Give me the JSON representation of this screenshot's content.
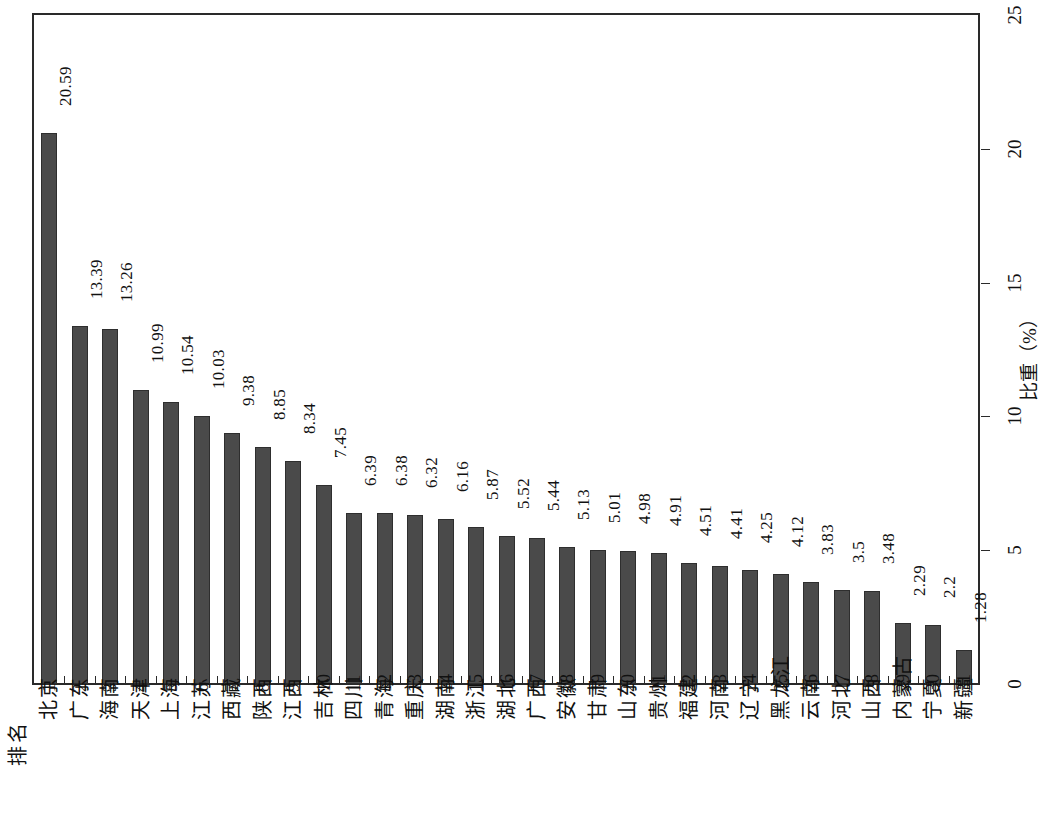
{
  "chart_data": {
    "type": "bar",
    "title": "",
    "orientation": "vertical-bars-rotated-page",
    "xlabel": "排名",
    "ylabel": "比重（%）",
    "ylim": [
      0,
      25
    ],
    "yticks": [
      0,
      5,
      10,
      15,
      20,
      25
    ],
    "grid": false,
    "legend": null,
    "bar_color": "#4a4a4a",
    "axis_color": "#2a2a2a",
    "categories": [
      "北京",
      "广东",
      "海南",
      "天津",
      "上海",
      "江苏",
      "西藏",
      "陕西",
      "江西",
      "吉林",
      "四川",
      "青海",
      "重庆",
      "湖南",
      "浙江",
      "湖北",
      "广西",
      "安徽",
      "甘肃",
      "山东",
      "贵州",
      "福建",
      "河南",
      "辽宁",
      "黑龙江",
      "云南",
      "河北",
      "山西",
      "内蒙古",
      "宁夏",
      "新疆"
    ],
    "ranks": [
      "1",
      "2",
      "3",
      "4",
      "5",
      "6",
      "7",
      "8",
      "9",
      "10",
      "11",
      "12",
      "13",
      "14",
      "15",
      "16",
      "17",
      "18",
      "19",
      "20",
      "21",
      "22",
      "23",
      "24",
      "25",
      "26",
      "27",
      "28",
      "29",
      "30",
      "31"
    ],
    "values": [
      20.59,
      13.39,
      13.26,
      10.99,
      10.54,
      10.03,
      9.38,
      8.85,
      8.34,
      7.45,
      6.39,
      6.38,
      6.32,
      6.16,
      5.87,
      5.52,
      5.44,
      5.13,
      5.01,
      4.98,
      4.91,
      4.51,
      4.41,
      4.25,
      4.12,
      3.83,
      3.5,
      3.48,
      2.29,
      2.2,
      1.28
    ],
    "value_labels": [
      "20.59",
      "13.39",
      "13.26",
      "10.99",
      "10.54",
      "10.03",
      "9.38",
      "8.85",
      "8.34",
      "7.45",
      "6.39",
      "6.38",
      "6.32",
      "6.16",
      "5.87",
      "5.52",
      "5.44",
      "5.13",
      "5.01",
      "4.98",
      "4.91",
      "4.51",
      "4.41",
      "4.25",
      "4.12",
      "3.83",
      "3.5",
      "3.48",
      "2.29",
      "2.2",
      "1.28"
    ],
    "ytick_labels": [
      "0",
      "5",
      "10",
      "15",
      "20",
      "25"
    ]
  }
}
